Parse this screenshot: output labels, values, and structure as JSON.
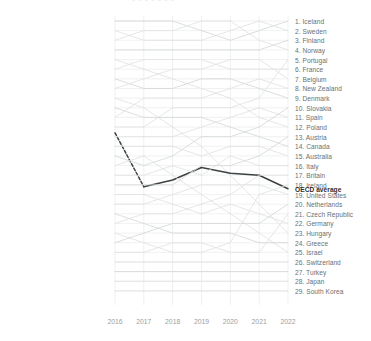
{
  "clipped_title": "- - - -  -  - -",
  "axis": {
    "x_ticks": [
      "2016",
      "2017",
      "2018",
      "2019",
      "2020",
      "2021",
      "2022"
    ],
    "x_tick_y": 318,
    "plot_left": 115,
    "plot_right": 288,
    "plot_top": 16,
    "plot_bottom": 305,
    "row_top": 21,
    "row_step": 9.64
  },
  "colors": {
    "grid": "#e3e5e6",
    "line_faint": "#e0e2e3",
    "line_mid": "#d5d8d9",
    "highlight": "#3c4143",
    "label": "#6a7072",
    "label_highlight": "#2b2f30",
    "axis_text": "#9aa0a2"
  },
  "left_labels": [
    "1. Iceland",
    "2. Sweden",
    "3. Norway",
    "4. Finland",
    "5. Poland",
    "6. France",
    "7. Denmark",
    "8. Belgium",
    "9. Hungary",
    "10. Canada",
    "11. New Zealand",
    "12. Portugal",
    "OECD average",
    "13. Spain",
    "14. Australia",
    "15. Slovakia",
    "16. Israel",
    "17. Italy",
    "18. Austria",
    "19. Germany",
    "20. United States",
    "21. Greece",
    "22. Britain",
    "23. Ireland",
    "24. Netherlands",
    "25. Czech Republic",
    "26. Switzerland",
    "27. Turkey",
    "28. Japan",
    "29. South Korea"
  ],
  "right_labels": [
    "1. Iceland",
    "2. Sweden",
    "3. Finland",
    "4. Norway",
    "5. Portugal",
    "6. France",
    "7. Belgium",
    "8. New Zealand",
    "9. Denmark",
    "10. Slovakia",
    "11. Spain",
    "12. Poland",
    "13. Austria",
    "14. Canada",
    "15. Australia",
    "16. Italy",
    "17. Britain",
    "18. Ireland",
    "OECD average",
    "19. United States",
    "20. Netherlands",
    "21. Czech Republic",
    "22. Germany",
    "23. Hungary",
    "24. Greece",
    "25. Israel",
    "26. Switzerland",
    "27. Turkey",
    "28. Japan",
    "29. South Korea"
  ],
  "chart_data": {
    "type": "line",
    "title": "",
    "xlabel": "",
    "ylabel": "Rank",
    "x": [
      "2016",
      "2017",
      "2018",
      "2019",
      "2020",
      "2021",
      "2022"
    ],
    "ylim": [
      30,
      1
    ],
    "grid": true,
    "legend": "none",
    "note": "Bump / rank chart. Each series is a country ranked 1-29 per year; OECD average is highlighted dark (dashed 2016-2017, solid thereafter). Left axis labels give 2016 order, right axis labels give 2022 order.",
    "series": [
      {
        "name": "Iceland",
        "values": [
          1,
          1,
          1,
          2,
          3,
          2,
          1
        ],
        "highlight": false
      },
      {
        "name": "Sweden",
        "values": [
          2,
          3,
          3,
          3,
          2,
          1,
          2
        ],
        "highlight": false
      },
      {
        "name": "Norway",
        "values": [
          3,
          2,
          2,
          1,
          1,
          3,
          4
        ],
        "highlight": false
      },
      {
        "name": "Finland",
        "values": [
          4,
          4,
          4,
          4,
          4,
          4,
          3
        ],
        "highlight": false
      },
      {
        "name": "Poland",
        "values": [
          5,
          6,
          7,
          8,
          9,
          11,
          12
        ],
        "highlight": false
      },
      {
        "name": "France",
        "values": [
          6,
          5,
          5,
          5,
          6,
          6,
          6
        ],
        "highlight": false
      },
      {
        "name": "Denmark",
        "values": [
          7,
          8,
          8,
          7,
          7,
          8,
          9
        ],
        "highlight": false
      },
      {
        "name": "Belgium",
        "values": [
          8,
          7,
          6,
          6,
          5,
          5,
          7
        ],
        "highlight": false
      },
      {
        "name": "Hungary",
        "values": [
          9,
          10,
          12,
          14,
          17,
          20,
          23
        ],
        "highlight": false
      },
      {
        "name": "Canada",
        "values": [
          10,
          11,
          11,
          11,
          12,
          13,
          14
        ],
        "highlight": false
      },
      {
        "name": "New Zealand",
        "values": [
          11,
          9,
          9,
          9,
          8,
          7,
          8
        ],
        "highlight": false
      },
      {
        "name": "Portugal",
        "values": [
          12,
          12,
          10,
          10,
          10,
          9,
          5
        ],
        "highlight": false
      },
      {
        "name": "OECD average",
        "values": [
          12.6,
          18.2,
          17.5,
          16.2,
          16.8,
          17.0,
          18.4
        ],
        "highlight": true,
        "dashed_until": 1
      },
      {
        "name": "Spain",
        "values": [
          13,
          13,
          13,
          12,
          11,
          10,
          11
        ],
        "highlight": false
      },
      {
        "name": "Australia",
        "values": [
          14,
          14,
          14,
          15,
          14,
          14,
          15
        ],
        "highlight": false
      },
      {
        "name": "Slovakia",
        "values": [
          15,
          16,
          15,
          13,
          13,
          12,
          10
        ],
        "highlight": false
      },
      {
        "name": "Israel",
        "values": [
          16,
          15,
          17,
          19,
          21,
          23,
          25
        ],
        "highlight": false
      },
      {
        "name": "Italy",
        "values": [
          17,
          17,
          16,
          17,
          15,
          16,
          16
        ],
        "highlight": false
      },
      {
        "name": "Austria",
        "values": [
          18,
          18,
          18,
          16,
          16,
          15,
          13
        ],
        "highlight": false
      },
      {
        "name": "Germany",
        "values": [
          19,
          19,
          20,
          21,
          20,
          21,
          22
        ],
        "highlight": false
      },
      {
        "name": "United States",
        "values": [
          20,
          20,
          19,
          18,
          18,
          18,
          19
        ],
        "highlight": false
      },
      {
        "name": "Greece",
        "values": [
          21,
          22,
          23,
          23,
          23,
          24,
          24
        ],
        "highlight": false
      },
      {
        "name": "Britain",
        "values": [
          22,
          21,
          21,
          20,
          19,
          17,
          17
        ],
        "highlight": false
      },
      {
        "name": "Ireland",
        "values": [
          23,
          24,
          25,
          25,
          24,
          19,
          18
        ],
        "highlight": false
      },
      {
        "name": "Netherlands",
        "values": [
          24,
          23,
          22,
          22,
          22,
          22,
          20
        ],
        "highlight": false
      },
      {
        "name": "Czech Republic",
        "values": [
          25,
          25,
          24,
          24,
          25,
          25,
          21
        ],
        "highlight": false
      },
      {
        "name": "Switzerland",
        "values": [
          26,
          26,
          26,
          26,
          26,
          26,
          26
        ],
        "highlight": false
      },
      {
        "name": "Turkey",
        "values": [
          27,
          27,
          27,
          27,
          27,
          27,
          27
        ],
        "highlight": false
      },
      {
        "name": "Japan",
        "values": [
          28,
          28,
          28,
          28,
          28,
          28,
          28
        ],
        "highlight": false
      },
      {
        "name": "South Korea",
        "values": [
          29,
          29,
          29,
          29,
          29,
          29,
          29
        ],
        "highlight": false
      }
    ]
  }
}
